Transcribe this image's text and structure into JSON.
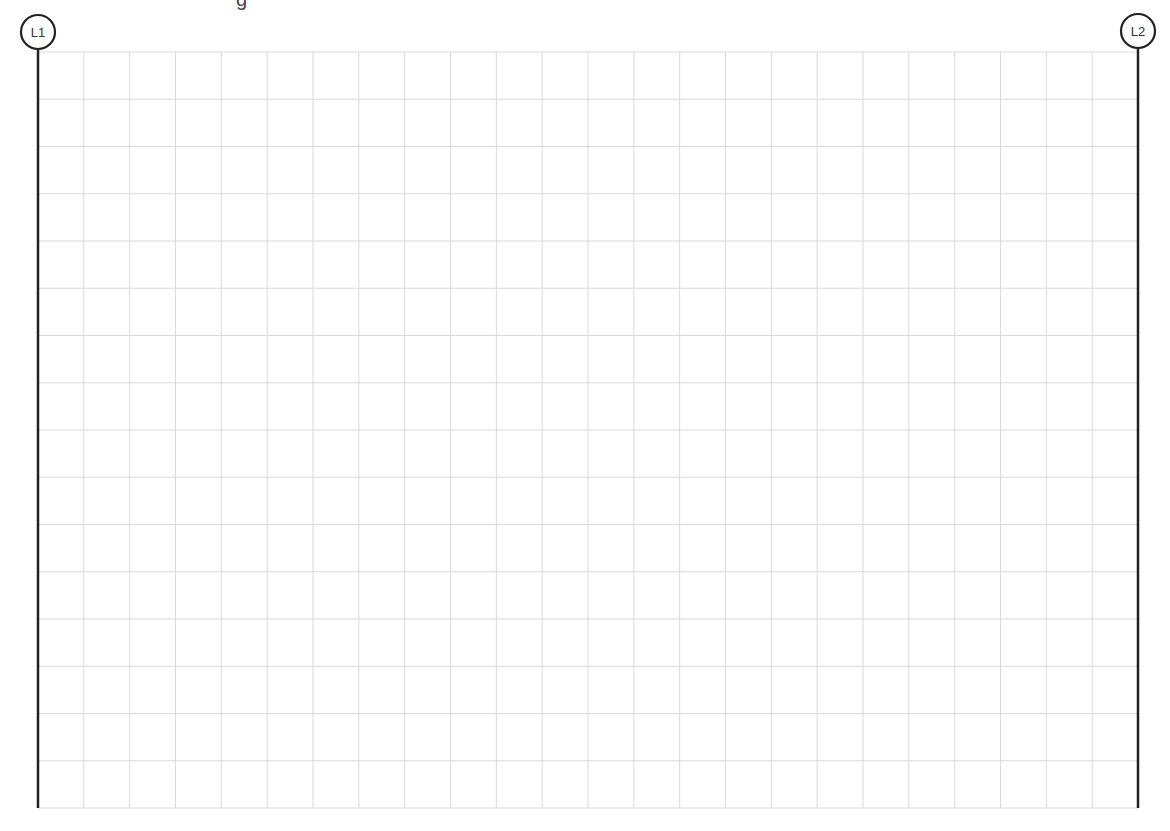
{
  "clipped_text": "g",
  "grid": {
    "left": 38,
    "top": 52,
    "right": 1138,
    "bottom": 808,
    "columns": 24,
    "rows": 16,
    "line_color": "#d9d9d9"
  },
  "gridlines": [
    {
      "id": "L1",
      "label": "L1",
      "x": 38,
      "circle_cy": 32,
      "line_top": 50,
      "line_bottom": 808
    },
    {
      "id": "L2",
      "label": "L2",
      "x": 1138,
      "circle_cy": 31,
      "line_top": 49,
      "line_bottom": 808
    }
  ],
  "colors": {
    "line": "#222222",
    "background": "#ffffff"
  }
}
